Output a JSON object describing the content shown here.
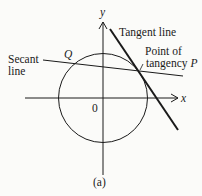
{
  "figure": {
    "caption": "(a)",
    "axes": {
      "x_label": "x",
      "y_label": "y",
      "origin_label": "0"
    },
    "labels": {
      "tangent_line": "Tangent line",
      "point_of_tangency_line1": "Point of",
      "point_of_tangency_line2": "tangency",
      "point_p": "P",
      "point_q": "Q",
      "secant_line1": "Secant",
      "secant_line2": "line"
    },
    "colors": {
      "background": "#fbfbf9",
      "ink": "#1a1a1a"
    }
  }
}
